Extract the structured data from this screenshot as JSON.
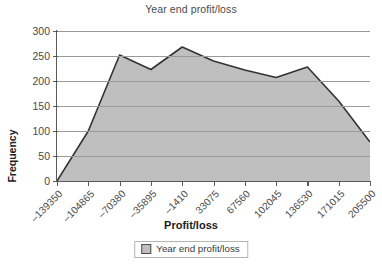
{
  "chart_data": {
    "type": "area",
    "title": "Year end profit/loss",
    "xlabel": "Profit/loss",
    "ylabel": "Frequency",
    "categories": [
      "-139350",
      "-104865",
      "-70380",
      "-35895",
      "-1410",
      "33075",
      "67560",
      "102045",
      "136530",
      "171015",
      "205500"
    ],
    "values": [
      0,
      100,
      252,
      223,
      268,
      240,
      222,
      207,
      228,
      160,
      78
    ],
    "series": [
      {
        "name": "Year end profit/loss",
        "values": [
          0,
          100,
          252,
          223,
          268,
          240,
          222,
          207,
          228,
          160,
          78
        ]
      }
    ],
    "ylim": [
      0,
      300
    ],
    "yticks": [
      0,
      50,
      100,
      150,
      200,
      250,
      300
    ],
    "grid": "horizontal",
    "legend_position": "bottom",
    "legend": [
      "Year end profit/loss"
    ],
    "colors": {
      "fill": "#bfbfbf",
      "line": "#333333",
      "grid": "#9a9a9a",
      "axis": "#5a5a5a"
    }
  },
  "legend": {
    "entry_label": "Year end profit/loss"
  }
}
